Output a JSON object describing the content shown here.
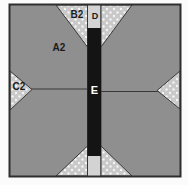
{
  "figure": {
    "labels": {
      "quadrant": "A2",
      "corner_triangle": "B2",
      "side_triangle": "C2",
      "top_strip": "D",
      "center_bar": "E"
    },
    "colors": {
      "paper": "#fbfbfb",
      "quadrant": "#8f8f8f",
      "dotted-base": "#c9c9c9",
      "dot": "#f4f4f4",
      "strip": "#d3d3d3",
      "bar": "#141414",
      "line": "#383838",
      "border": "#2e2e2e",
      "label": "#1b1b1b",
      "bar-label": "#ffffff"
    }
  }
}
